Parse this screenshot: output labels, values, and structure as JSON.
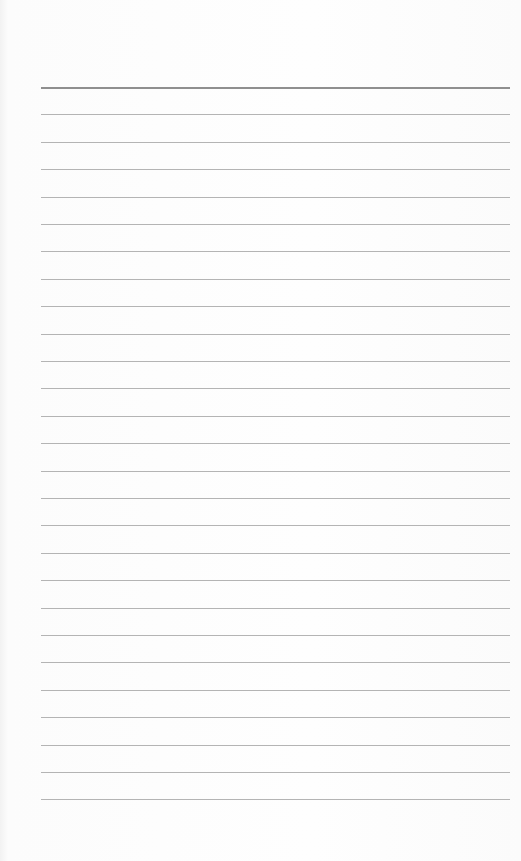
{
  "paper": {
    "type": "lined paper",
    "line_count": 27,
    "first_line_y": 87,
    "line_spacing": 27.4,
    "line_left": 41,
    "line_width": 469,
    "line_color": "#b4b4b4",
    "header_line_color": "#8f8f8f",
    "background": "#fdfdfd"
  }
}
